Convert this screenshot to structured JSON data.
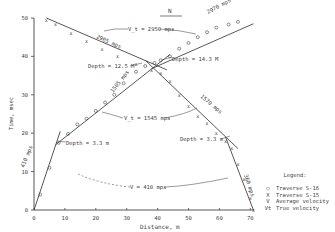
{
  "chart_data": {
    "type": "scatter",
    "title": "",
    "xlabel": "Distance, m",
    "ylabel": "Time, msec",
    "xlim": [
      0,
      72
    ],
    "ylim": [
      0,
      50
    ],
    "x_ticks": [
      "0",
      "10",
      "20",
      "30",
      "40",
      "50",
      "60",
      "70"
    ],
    "y_ticks": [
      "0",
      "10",
      "20",
      "30",
      "40",
      "50"
    ],
    "grid": false,
    "north_arrow": "N",
    "series": [
      {
        "name": "Traverse S-16",
        "marker": "o",
        "points": [
          [
            2,
            4
          ],
          [
            5,
            11
          ],
          [
            8,
            17.5
          ],
          [
            11,
            19.8
          ],
          [
            14,
            22.3
          ],
          [
            17,
            23.8
          ],
          [
            20,
            25.8
          ],
          [
            23,
            28
          ],
          [
            26,
            30
          ],
          [
            29,
            33
          ],
          [
            33,
            36
          ],
          [
            36,
            37.5
          ],
          [
            39,
            38.3
          ],
          [
            41,
            39
          ],
          [
            44,
            40
          ],
          [
            47,
            42
          ],
          [
            50,
            43.5
          ],
          [
            53,
            45
          ],
          [
            56,
            46.3
          ],
          [
            59,
            47.5
          ],
          [
            63,
            48.3
          ],
          [
            66,
            49
          ]
        ]
      },
      {
        "name": "Traverse S-15",
        "marker": "x",
        "points": [
          [
            4,
            49.5
          ],
          [
            7,
            48.5
          ],
          [
            12,
            46
          ],
          [
            17,
            44
          ],
          [
            22,
            42
          ],
          [
            27,
            40
          ],
          [
            33,
            38
          ],
          [
            38,
            36.5
          ],
          [
            41,
            35.5
          ],
          [
            44,
            33.5
          ],
          [
            47,
            30
          ],
          [
            50,
            27
          ],
          [
            53,
            24.5
          ],
          [
            56,
            22.5
          ],
          [
            59,
            20
          ],
          [
            62,
            18
          ],
          [
            64,
            16
          ],
          [
            66,
            12
          ],
          [
            68,
            8
          ],
          [
            70,
            3
          ],
          [
            71,
            0
          ]
        ]
      }
    ],
    "fit_lines": [
      {
        "label": "410 mps",
        "from": [
          0,
          0
        ],
        "to": [
          8.5,
          20.5
        ]
      },
      {
        "label": "1505 mps",
        "from": [
          7,
          17
        ],
        "to": [
          44,
          40.5
        ]
      },
      {
        "label": "2970 mps",
        "from": [
          38,
          36.8
        ],
        "to": [
          71,
          48.5
        ]
      },
      {
        "label": "2905 mps",
        "from": [
          4,
          50
        ],
        "to": [
          43,
          36.5
        ]
      },
      {
        "label": "1570 mps",
        "from": [
          36,
          39
        ],
        "to": [
          66,
          16
        ]
      },
      {
        "label": "360 mps",
        "from": [
          62,
          19
        ],
        "to": [
          71,
          0
        ]
      }
    ],
    "annotations": [
      {
        "text": "V_t = 2950 mps",
        "x": 31,
        "y": 47
      },
      {
        "text": "Depth = 12.5 M",
        "x": 24,
        "y": 39
      },
      {
        "text": "Depth = 14.3 M",
        "x": 46,
        "y": 36.5
      },
      {
        "text": "V_t = 1545 mps",
        "x": 27,
        "y": 26
      },
      {
        "text": "Depth = 3.3 m",
        "x": 13,
        "y": 17
      },
      {
        "text": "Depth = 3.3 m",
        "x": 49,
        "y": 18.5
      },
      {
        "text": "V = 410 mps",
        "x": 33,
        "y": 7
      }
    ],
    "legend": {
      "title": "Legend:",
      "position": "right",
      "entries": [
        {
          "symbol": "○",
          "label": "Traverse S-16"
        },
        {
          "symbol": "X",
          "label": "Traverse S-15"
        },
        {
          "symbol": "V",
          "label": "Average velocity"
        },
        {
          "symbol": "Vt",
          "label": "True velocity"
        }
      ]
    }
  }
}
